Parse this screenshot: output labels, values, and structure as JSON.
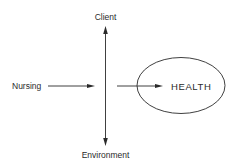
{
  "diagram": {
    "nodes": {
      "client": "Client",
      "nursing": "Nursing",
      "environment": "Environment",
      "health": "HEALTH"
    },
    "edges": [
      {
        "from": "Nursing",
        "to": "center-axis",
        "type": "arrow"
      },
      {
        "from": "center-axis",
        "to": "HEALTH",
        "type": "arrow"
      },
      {
        "from": "Environment",
        "to": "Client",
        "type": "double-arrow",
        "orientation": "vertical"
      }
    ],
    "colors": {
      "line": "#2a2a2a",
      "text": "#2a2a2a",
      "background": "#ffffff"
    }
  }
}
